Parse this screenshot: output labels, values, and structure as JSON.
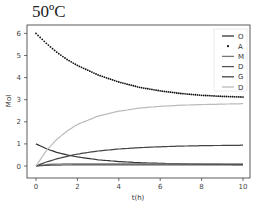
{
  "chart_data": {
    "type": "line",
    "title": "50ºC",
    "xlabel": "t(h)",
    "ylabel": "Mol",
    "xlim": [
      -0.6,
      10.4
    ],
    "ylim": [
      -0.35,
      6.35
    ],
    "xticks": [
      0,
      2,
      4,
      6,
      8,
      10
    ],
    "yticks": [
      0,
      1,
      2,
      3,
      4,
      5,
      6
    ],
    "grid": false,
    "legend_position": "upper right",
    "series": [
      {
        "name": "O",
        "style": "solid",
        "color": "#333333",
        "x": [
          0,
          0.5,
          1,
          1.5,
          2,
          3,
          4,
          5,
          6,
          7,
          8,
          9,
          10
        ],
        "values": [
          1.0,
          0.78,
          0.62,
          0.5,
          0.41,
          0.28,
          0.2,
          0.15,
          0.12,
          0.1,
          0.08,
          0.07,
          0.06
        ]
      },
      {
        "name": "A",
        "style": "dots",
        "color": "#111111",
        "x": [
          0,
          0.5,
          1,
          1.5,
          2,
          3,
          4,
          5,
          6,
          7,
          8,
          9,
          10
        ],
        "values": [
          6.0,
          5.55,
          5.15,
          4.82,
          4.55,
          4.12,
          3.8,
          3.56,
          3.4,
          3.28,
          3.2,
          3.15,
          3.12
        ]
      },
      {
        "name": "M",
        "style": "solid",
        "color": "#777777",
        "x": [
          0,
          0.5,
          1,
          2,
          3,
          4,
          5,
          6,
          7,
          8,
          9,
          10
        ],
        "values": [
          0.0,
          0.07,
          0.09,
          0.1,
          0.1,
          0.1,
          0.1,
          0.1,
          0.1,
          0.1,
          0.1,
          0.1
        ]
      },
      {
        "name": "D",
        "style": "solid",
        "color": "#555555",
        "x": [
          0,
          0.5,
          1,
          2,
          3,
          4,
          5,
          6,
          7,
          8,
          9,
          10
        ],
        "values": [
          0.0,
          0.03,
          0.04,
          0.05,
          0.05,
          0.05,
          0.05,
          0.05,
          0.05,
          0.05,
          0.05,
          0.05
        ]
      },
      {
        "name": "G",
        "style": "solid",
        "color": "#444444",
        "x": [
          0,
          0.5,
          1,
          1.5,
          2,
          3,
          4,
          5,
          6,
          7,
          8,
          9,
          10
        ],
        "values": [
          0.0,
          0.18,
          0.32,
          0.44,
          0.54,
          0.68,
          0.77,
          0.83,
          0.87,
          0.9,
          0.92,
          0.93,
          0.94
        ]
      },
      {
        "name": "D",
        "style": "solid",
        "color": "#bbbbbb",
        "x": [
          0,
          0.5,
          1,
          1.5,
          2,
          3,
          4,
          5,
          6,
          7,
          8,
          9,
          10
        ],
        "values": [
          0.0,
          0.7,
          1.2,
          1.58,
          1.88,
          2.26,
          2.48,
          2.62,
          2.7,
          2.75,
          2.78,
          2.8,
          2.82
        ]
      }
    ]
  }
}
